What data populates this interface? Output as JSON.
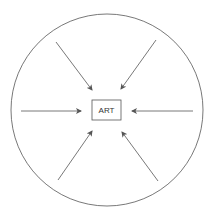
{
  "diagram": {
    "center_label": "ART",
    "stroke_color": "#555555",
    "background": "#ffffff",
    "circle": {
      "cx": 107,
      "cy": 110,
      "r": 96
    },
    "box": {
      "x": 92,
      "y": 100,
      "width": 29,
      "height": 20
    },
    "arrows": [
      {
        "name": "arrow-top-left",
        "x1": 56,
        "y1": 42,
        "x2": 92,
        "y2": 90
      },
      {
        "name": "arrow-top-right",
        "x1": 156,
        "y1": 40,
        "x2": 121,
        "y2": 89
      },
      {
        "name": "arrow-left",
        "x1": 21,
        "y1": 111,
        "x2": 81,
        "y2": 111
      },
      {
        "name": "arrow-right",
        "x1": 193,
        "y1": 111,
        "x2": 132,
        "y2": 111
      },
      {
        "name": "arrow-bottom-left",
        "x1": 58,
        "y1": 180,
        "x2": 92,
        "y2": 131
      },
      {
        "name": "arrow-bottom-right",
        "x1": 158,
        "y1": 181,
        "x2": 122,
        "y2": 132
      }
    ]
  }
}
